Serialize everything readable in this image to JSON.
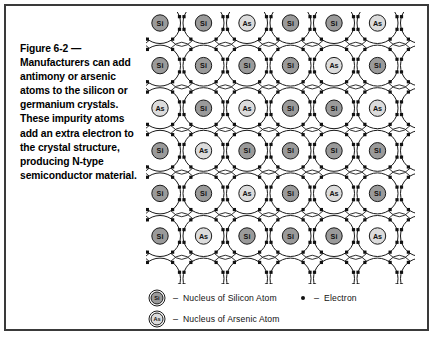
{
  "figure": {
    "caption": "Figure 6-2 — Manufacturers can add antimony or arsenic atoms to the silicon or germanium crystals. These impurity atoms add an extra electron to the crystal structure, producing N-type semiconductor material."
  },
  "lattice": {
    "rows": 6,
    "cols": 6,
    "grid": [
      [
        "Si",
        "Si",
        "As",
        "Si",
        "Si",
        "As"
      ],
      [
        "Si",
        "Si",
        "Si",
        "Si",
        "As",
        "Si"
      ],
      [
        "As",
        "Si",
        "As",
        "Si",
        "Si",
        "As"
      ],
      [
        "Si",
        "As",
        "Si",
        "Si",
        "Si",
        "Si"
      ],
      [
        "Si",
        "Si",
        "As",
        "Si",
        "As",
        "Si"
      ],
      [
        "Si",
        "As",
        "Si",
        "Si",
        "Si",
        "As"
      ]
    ],
    "silicon_label": "Si",
    "arsenic_label": "As"
  },
  "legend": {
    "dash": "–",
    "items": [
      {
        "symbol": "Si",
        "kind": "silicon",
        "text": "Nucleus of Silicon Atom"
      },
      {
        "symbol": "As",
        "kind": "arsenic",
        "text": "Nucleus of Arsenic Atom"
      },
      {
        "symbol": "",
        "kind": "electron",
        "text": "Electron"
      }
    ]
  },
  "colors": {
    "border": "#3a3a3a",
    "line": "#1a1a1a",
    "silicon_fill": "#9a9a9a",
    "arsenic_fill": "#dcdcdc",
    "electron": "#111111",
    "background": "#ffffff"
  }
}
